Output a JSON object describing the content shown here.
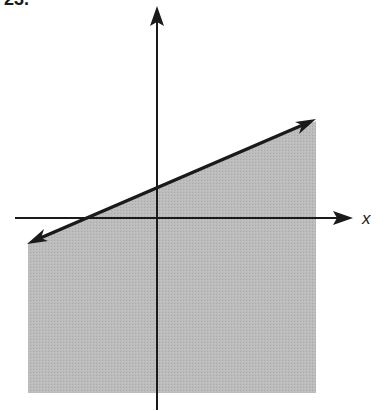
{
  "problem": {
    "number": "23."
  },
  "axes": {
    "x_label": "x",
    "y_label": ""
  },
  "colors": {
    "shade": "#b8b8b8",
    "line": "#1a1a1a",
    "axis": "#1a1a1a",
    "background": "#ffffff"
  },
  "graph": {
    "description": "Graph of a linear inequality: a solid line with positive slope and positive y-intercept, region below the line shaded",
    "boundary_line": {
      "style": "solid",
      "slope": "positive",
      "y_intercept": "positive",
      "x_intercept": "negative"
    },
    "shaded_region": "below line"
  }
}
